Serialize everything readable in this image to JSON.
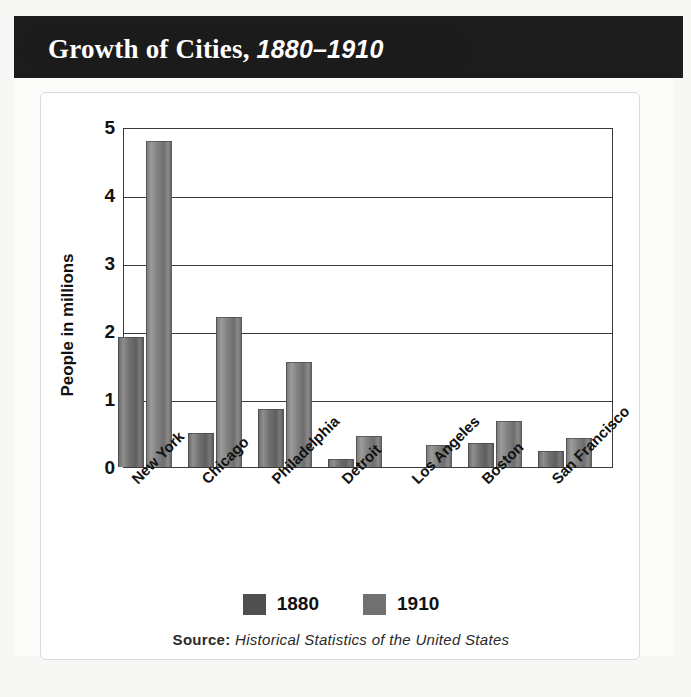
{
  "title": {
    "main": "Growth of Cities,",
    "years": "1880–1910"
  },
  "chart_data": {
    "type": "bar",
    "title": "Growth of Cities, 1880–1910",
    "xlabel": "",
    "ylabel": "People in millions",
    "ylim": [
      0,
      5
    ],
    "yticks": [
      "0",
      "1",
      "2",
      "3",
      "4",
      "5"
    ],
    "grid": true,
    "legend_position": "bottom",
    "categories": [
      "New York",
      "Chicago",
      "Philadelphia",
      "Detroit",
      "Los Angeles",
      "Boston",
      "San Francisco"
    ],
    "series": [
      {
        "name": "1880",
        "color": "#4f4f4f",
        "values": [
          1.91,
          0.5,
          0.86,
          0.12,
          0.01,
          0.36,
          0.23
        ]
      },
      {
        "name": "1910",
        "color": "#717171",
        "values": [
          4.79,
          2.2,
          1.55,
          0.46,
          0.33,
          0.67,
          0.42
        ]
      }
    ],
    "source_label": "Source:",
    "source_title": "Historical Statistics of the United States"
  },
  "legend": [
    {
      "label": "1880"
    },
    {
      "label": "1910"
    }
  ],
  "source": {
    "label": "Source:",
    "title": "Historical Statistics of the United States"
  }
}
